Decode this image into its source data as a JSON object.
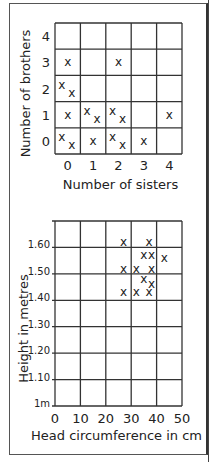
{
  "chart_data": [
    {
      "type": "scatter",
      "title": "",
      "xlabel": "Number of sisters",
      "ylabel": "Number of brothers",
      "x_ticks": [
        "0",
        "1",
        "2",
        "3",
        "4"
      ],
      "y_ticks": [
        "0",
        "1",
        "2",
        "3",
        "4"
      ],
      "grid": true,
      "xlim": [
        0,
        4
      ],
      "ylim": [
        0,
        4
      ],
      "points": [
        {
          "sisters": 0,
          "brothers": 3
        },
        {
          "sisters": 2,
          "brothers": 3
        },
        {
          "sisters": 0,
          "brothers": 2
        },
        {
          "sisters": 0,
          "brothers": 2
        },
        {
          "sisters": 0,
          "brothers": 1
        },
        {
          "sisters": 1,
          "brothers": 1
        },
        {
          "sisters": 1,
          "brothers": 1
        },
        {
          "sisters": 2,
          "brothers": 1
        },
        {
          "sisters": 2,
          "brothers": 1
        },
        {
          "sisters": 4,
          "brothers": 1
        },
        {
          "sisters": 0,
          "brothers": 0
        },
        {
          "sisters": 0,
          "brothers": 0
        },
        {
          "sisters": 1,
          "brothers": 0
        },
        {
          "sisters": 2,
          "brothers": 0
        },
        {
          "sisters": 2,
          "brothers": 0
        },
        {
          "sisters": 3,
          "brothers": 0
        }
      ]
    },
    {
      "type": "scatter",
      "title": "",
      "xlabel": "Head circumference in cm",
      "ylabel": "Height in metres",
      "x_ticks": [
        "0",
        "10",
        "20",
        "30",
        "40",
        "50"
      ],
      "y_ticks": [
        "1m",
        "1.10",
        "1.20",
        "1.30",
        "1.40",
        "1.50",
        "1.60"
      ],
      "grid": true,
      "xlim": [
        0,
        50
      ],
      "ylim": [
        1.0,
        1.7
      ],
      "points": [
        {
          "x": 27,
          "y": 1.62
        },
        {
          "x": 37,
          "y": 1.62
        },
        {
          "x": 35,
          "y": 1.57
        },
        {
          "x": 38,
          "y": 1.57
        },
        {
          "x": 43,
          "y": 1.56
        },
        {
          "x": 27,
          "y": 1.52
        },
        {
          "x": 32,
          "y": 1.52
        },
        {
          "x": 38,
          "y": 1.52
        },
        {
          "x": 35,
          "y": 1.48
        },
        {
          "x": 38,
          "y": 1.46
        },
        {
          "x": 27,
          "y": 1.43
        },
        {
          "x": 32,
          "y": 1.43
        },
        {
          "x": 37,
          "y": 1.43
        }
      ]
    }
  ],
  "marker_glyph": "x"
}
